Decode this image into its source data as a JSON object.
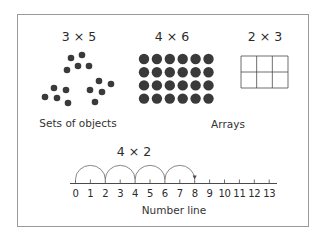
{
  "diagram": {
    "sets": {
      "title": "3 × 5",
      "caption": "Sets of objects",
      "groups": [
        {
          "dots": [
            [
              71,
              58
            ],
            [
              82,
              55
            ],
            [
              67,
              70
            ],
            [
              78,
              66
            ],
            [
              89,
              66
            ]
          ]
        },
        {
          "dots": [
            [
              54,
              88
            ],
            [
              45,
              97
            ],
            [
              57,
              98
            ],
            [
              66,
              90
            ],
            [
              68,
              103
            ]
          ]
        },
        {
          "dots": [
            [
              99,
              81
            ],
            [
              90,
              90
            ],
            [
              102,
              92
            ],
            [
              111,
              84
            ],
            [
              95,
              102
            ]
          ]
        }
      ]
    },
    "array": {
      "title": "4 × 6",
      "caption": "Arrays",
      "rows": 4,
      "cols": 6
    },
    "grid": {
      "title": "2 × 3",
      "rows": 2,
      "cols": 3
    },
    "number_line": {
      "title": "4 × 2",
      "caption": "Number line",
      "ticks": [
        "0",
        "1",
        "2",
        "3",
        "4",
        "5",
        "6",
        "7",
        "8",
        "9",
        "10",
        "11",
        "12",
        "13"
      ],
      "jumps": [
        [
          0,
          2
        ],
        [
          2,
          4
        ],
        [
          4,
          6
        ],
        [
          6,
          8
        ]
      ],
      "jump_size": 2,
      "jump_count": 4,
      "end_value": 8
    },
    "colors": {
      "dot": "#3a3a3a",
      "line": "#4a4a4a",
      "frame": "#9a9a9a"
    }
  }
}
